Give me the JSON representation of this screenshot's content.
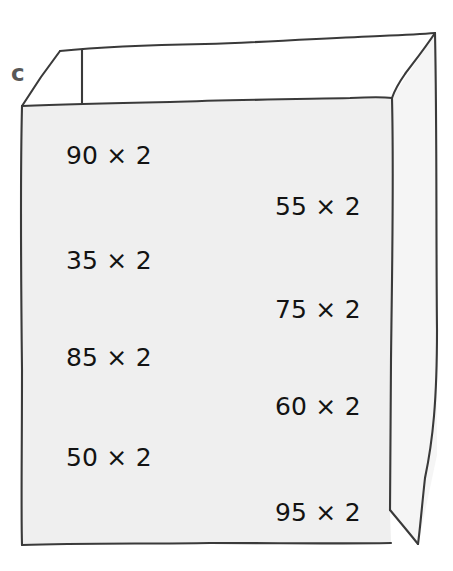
{
  "illustration": {
    "name": "open-cardboard-box",
    "label": "c",
    "face_fill": "#efefef",
    "inner_fill": "#ffffff",
    "side_fill": "#f4f4f4",
    "stroke": "#3a3a3a",
    "background": "#ffffff"
  },
  "expressions": [
    {
      "text": "90 × 2",
      "operand_a": "90",
      "operator": "×",
      "operand_b": "2",
      "column": "left",
      "x": 66,
      "y": 143
    },
    {
      "text": "55 × 2",
      "operand_a": "55",
      "operator": "×",
      "operand_b": "2",
      "column": "right",
      "x": 275,
      "y": 194
    },
    {
      "text": "35 × 2",
      "operand_a": "35",
      "operator": "×",
      "operand_b": "2",
      "column": "left",
      "x": 66,
      "y": 248
    },
    {
      "text": "75 × 2",
      "operand_a": "75",
      "operator": "×",
      "operand_b": "2",
      "column": "right",
      "x": 275,
      "y": 297
    },
    {
      "text": "85 × 2",
      "operand_a": "85",
      "operator": "×",
      "operand_b": "2",
      "column": "left",
      "x": 66,
      "y": 345
    },
    {
      "text": "60 × 2",
      "operand_a": "60",
      "operator": "×",
      "operand_b": "2",
      "column": "right",
      "x": 275,
      "y": 394
    },
    {
      "text": "50 × 2",
      "operand_a": "50",
      "operator": "×",
      "operand_b": "2",
      "column": "left",
      "x": 66,
      "y": 445
    },
    {
      "text": "95 × 2",
      "operand_a": "95",
      "operator": "×",
      "operand_b": "2",
      "column": "right",
      "x": 275,
      "y": 500
    }
  ]
}
